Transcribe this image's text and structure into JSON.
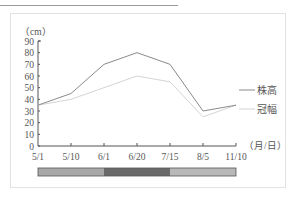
{
  "chart_data": {
    "type": "line",
    "title": "",
    "ylabel": "（cm）",
    "xlabel": "（月/日）",
    "ylim": [
      0,
      90
    ],
    "yticks": [
      0,
      10,
      20,
      30,
      40,
      50,
      60,
      70,
      80,
      90
    ],
    "categories": [
      "5/1",
      "5/10",
      "6/1",
      "6/20",
      "7/15",
      "8/5",
      "11/10"
    ],
    "series": [
      {
        "name": "株高",
        "color": "#8a8a8a",
        "values": [
          35,
          45,
          70,
          80,
          70,
          30,
          35
        ]
      },
      {
        "name": "冠幅",
        "color": "#d4d4d4",
        "values": [
          35,
          40,
          50,
          60,
          55,
          25,
          35
        ]
      }
    ],
    "grid": false,
    "legend_position": "right",
    "phase_bar": {
      "segments": [
        {
          "from": "5/1",
          "to": "6/1",
          "shade": "#a8a8a8"
        },
        {
          "from": "6/1",
          "to": "7/15",
          "shade": "#6a6a6a"
        },
        {
          "from": "7/15",
          "to": "11/10",
          "shade": "#b8b8b8"
        }
      ]
    }
  },
  "labels": {
    "y_unit": "（cm）",
    "x_unit": "（月/日）",
    "legend_height": "株高",
    "legend_crown": "冠幅"
  }
}
